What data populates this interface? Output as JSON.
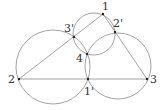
{
  "diagram": {
    "stroke_color": "#8a8a8a",
    "point_color": "#222222",
    "points": [
      {
        "id": "p1",
        "label": "1",
        "x": 103,
        "y": 14,
        "lx": 102,
        "ly": 10
      },
      {
        "id": "p2",
        "label": "2",
        "x": 19,
        "y": 79,
        "lx": 8,
        "ly": 83
      },
      {
        "id": "p3",
        "label": "3",
        "x": 147,
        "y": 79,
        "lx": 150,
        "ly": 83
      },
      {
        "id": "p4",
        "label": "4",
        "x": 87,
        "y": 54,
        "lx": 76,
        "ly": 62
      },
      {
        "id": "p1p",
        "label": "1'",
        "x": 88,
        "y": 79,
        "lx": 84,
        "ly": 95
      },
      {
        "id": "p2p",
        "label": "2'",
        "x": 115,
        "y": 32,
        "lx": 113,
        "ly": 27
      },
      {
        "id": "p3p",
        "label": "3'",
        "x": 74,
        "y": 37,
        "lx": 64,
        "ly": 32
      }
    ],
    "segments": [
      {
        "from": "p2",
        "to": "p1"
      },
      {
        "from": "p2",
        "to": "p3"
      },
      {
        "from": "p1",
        "to": "p3"
      }
    ],
    "circles": [
      {
        "name": "circle-through-2-3p-1p",
        "cx": 53,
        "cy": 67,
        "r": 37
      },
      {
        "name": "circle-through-1-2p-3p",
        "cx": 94,
        "cy": 34,
        "r": 21
      },
      {
        "name": "circle-through-3-1p-2p",
        "cx": 118,
        "cy": 66,
        "r": 33
      }
    ]
  }
}
